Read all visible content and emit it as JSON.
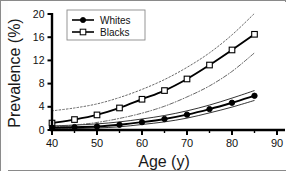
{
  "figure": {
    "title": "",
    "frame_color": "#8a8a8a",
    "background": "#ffffff"
  },
  "axes": {
    "x": {
      "label": "Age (y)",
      "min": 40,
      "max": 90,
      "major_ticks": [
        40,
        50,
        60,
        70,
        80,
        90
      ],
      "minor_ticks": [
        45,
        55,
        65,
        75,
        85
      ],
      "tick_labels": [
        "40",
        "50",
        "60",
        "70",
        "80",
        "90"
      ]
    },
    "y": {
      "label": "Prevalence (%)",
      "min": 0,
      "max": 20,
      "major_ticks": [
        0,
        4,
        8,
        12,
        16,
        20
      ],
      "tick_labels": [
        "0",
        "4",
        "8",
        "12",
        "16",
        "20"
      ]
    }
  },
  "legend": {
    "position": "top-left-inside",
    "entries": [
      {
        "label": "Whites",
        "marker": "filled-circle",
        "line": "solid",
        "color": "#000000"
      },
      {
        "label": "Blacks",
        "marker": "open-square",
        "line": "solid",
        "color": "#000000"
      }
    ]
  },
  "chart_data": {
    "type": "line",
    "title": "",
    "xlabel": "Age (y)",
    "ylabel": "Prevalence (%)",
    "xlim": [
      40,
      90
    ],
    "ylim": [
      0,
      20
    ],
    "grid": false,
    "legend_position": "top-left-inside",
    "x": [
      40,
      45,
      50,
      55,
      60,
      65,
      70,
      75,
      80,
      85
    ],
    "series": [
      {
        "name": "Whites",
        "marker": "filled-circle",
        "linestyle": "solid",
        "values": [
          0.4,
          0.5,
          0.6,
          0.9,
          1.35,
          1.9,
          2.65,
          3.6,
          4.7,
          5.9
        ],
        "ci_upper": {
          "name": "Whites upper 95% CI",
          "linestyle": "solid-thin",
          "values": [
            0.7,
            0.85,
            1.05,
            1.4,
            1.9,
            2.5,
            3.3,
            4.3,
            5.5,
            6.8
          ]
        },
        "ci_lower": {
          "name": "Whites lower 95% CI",
          "linestyle": "solid-thin",
          "values": [
            0.2,
            0.25,
            0.35,
            0.55,
            0.95,
            1.4,
            2.05,
            2.95,
            3.95,
            5.1
          ]
        }
      },
      {
        "name": "Blacks",
        "marker": "open-square",
        "linestyle": "solid",
        "values": [
          1.2,
          1.8,
          2.6,
          3.8,
          5.3,
          6.8,
          8.8,
          11.2,
          13.8,
          16.5
        ],
        "ci_upper": {
          "name": "Blacks upper 95% CI",
          "linestyle": "dotted",
          "values": [
            3.3,
            3.8,
            4.5,
            5.6,
            7.0,
            8.7,
            10.8,
            13.3,
            16.4,
            20.1
          ]
        },
        "ci_lower": {
          "name": "Blacks lower 95% CI",
          "linestyle": "dash-dot",
          "values": [
            0.55,
            0.85,
            1.3,
            2.0,
            2.9,
            4.1,
            5.7,
            7.6,
            10.1,
            13.3
          ]
        }
      }
    ]
  }
}
